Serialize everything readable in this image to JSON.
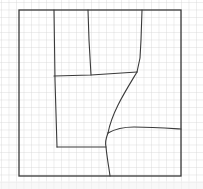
{
  "diagram": {
    "kind": "hand-drawn floor plan sketch on graph paper",
    "paper": {
      "background": "#ffffff",
      "grid_color": "#d4d4d4",
      "grid_spacing_px": 7.5
    },
    "ink_color": "#3a3a3a",
    "outer_boundary": {
      "x": 19,
      "y": 10,
      "width": 162,
      "height": 166
    },
    "strokes": [
      {
        "name": "left-inner-wall",
        "points": "54,10 55,80 57,147"
      },
      {
        "name": "upper-divider-wall",
        "points": "88,10 89,40 91,75"
      },
      {
        "name": "middle-horizontal-wall",
        "points": "54,76 91,75 137,72"
      },
      {
        "name": "right-upper-curve",
        "points": "142,10 141,40 140,58 137,72"
      },
      {
        "name": "diagonal-curve",
        "path": "M137,72 C125,92 112,112 108,133"
      },
      {
        "name": "lower-vertical-wall",
        "path": "M108,133 C106,138 105,143 106,147 C107,158 109,168 110,176"
      },
      {
        "name": "bottom-inner-wall",
        "points": "57,147 106,147"
      },
      {
        "name": "right-branch-wall",
        "path": "M108,133 C115,129 125,127 134,127 C150,127 165,128 181,129"
      }
    ]
  }
}
